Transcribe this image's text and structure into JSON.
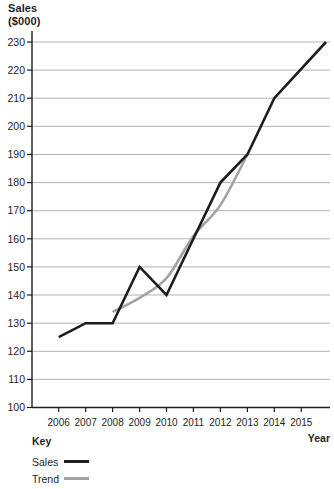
{
  "y_axis_title": {
    "line1": "Sales",
    "line2": "($000)"
  },
  "chart_data": {
    "type": "line",
    "xlabel": "Year",
    "ylabel": "Sales ($000)",
    "categories": [
      2006,
      2007,
      2008,
      2009,
      2010,
      2011,
      2012,
      2013,
      2014,
      2015
    ],
    "ylim": [
      100,
      230
    ],
    "y_ticks": [
      100,
      110,
      120,
      130,
      140,
      150,
      160,
      170,
      180,
      190,
      200,
      210,
      220,
      230
    ],
    "grid": true,
    "legend": {
      "title": "Key",
      "position": "below-left"
    },
    "colors": {
      "grid": "#b3b3b3",
      "axis": "#1d1d1d",
      "text": "#242424"
    },
    "series": [
      {
        "name": "Sales",
        "color": "#1d1d1d",
        "x": [
          2006,
          2007,
          2008,
          2009,
          2010,
          2011,
          2012,
          2013,
          2014,
          2015
        ],
        "values": [
          125,
          130,
          130,
          150,
          140,
          160,
          180,
          190,
          210,
          230
        ],
        "smooth": false,
        "extend_last_to_plot_edge": true
      },
      {
        "name": "Trend",
        "color": "#a3a3a3",
        "x": [
          2008,
          2009,
          2010,
          2011,
          2012,
          2013
        ],
        "values": [
          134,
          139,
          146,
          161,
          172,
          190
        ],
        "smooth": true,
        "extend_last_to_plot_edge": false
      }
    ]
  }
}
